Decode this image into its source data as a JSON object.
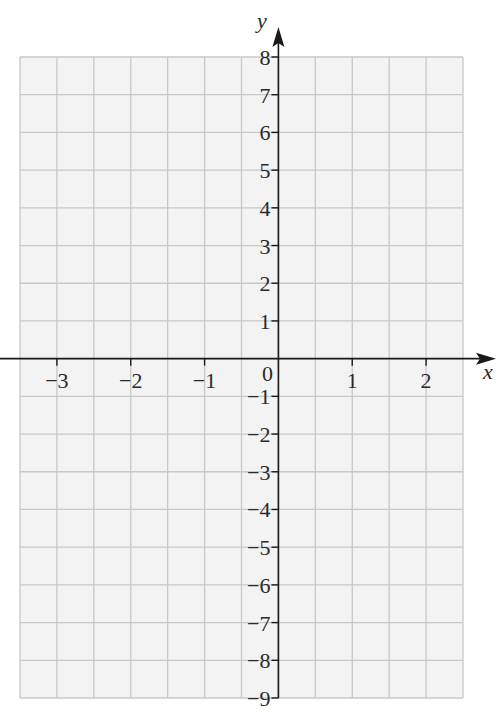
{
  "chart_data": {
    "type": "scatter",
    "title": "",
    "xlabel": "x",
    "ylabel": "y",
    "xlim": [
      -3.5,
      2.5
    ],
    "ylim": [
      -9,
      8
    ],
    "grid": true,
    "grid_step": {
      "x": 0.5,
      "y": 1
    },
    "x_ticks": [
      -3,
      -2,
      -1,
      1,
      2
    ],
    "x_tick_labels": [
      "−3",
      "−2",
      "−1",
      "1",
      "2"
    ],
    "y_ticks": [
      8,
      7,
      6,
      5,
      4,
      3,
      2,
      1,
      -1,
      -2,
      -3,
      -4,
      -5,
      -6,
      -7,
      -8,
      -9
    ],
    "y_tick_labels": [
      "8",
      "7",
      "6",
      "5",
      "4",
      "3",
      "2",
      "1",
      "−1",
      "−2",
      "−3",
      "−4",
      "−5",
      "−6",
      "−7",
      "−8",
      "−9"
    ],
    "origin_label": "0",
    "series": [],
    "colors": {
      "background": "#f3f3f3",
      "grid": "#c8c8c8",
      "axis": "#1a1a1a"
    }
  }
}
